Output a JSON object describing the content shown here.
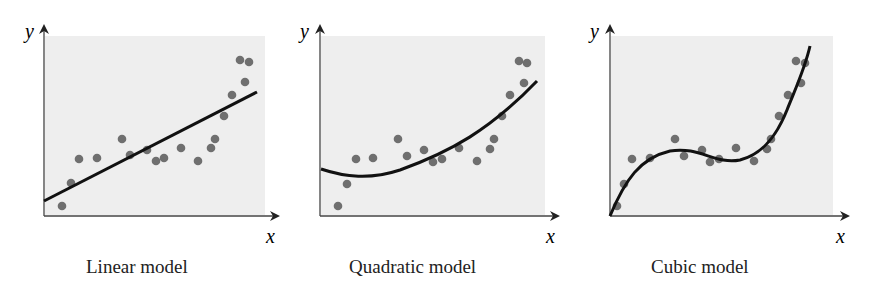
{
  "chart_data": [
    {
      "type": "scatter",
      "title": "Linear model",
      "xlabel": "x",
      "ylabel": "y",
      "grid": false,
      "points_px": [
        [
          62,
          206
        ],
        [
          71,
          183
        ],
        [
          79,
          159
        ],
        [
          97,
          158
        ],
        [
          122,
          139
        ],
        [
          130,
          155
        ],
        [
          147,
          150
        ],
        [
          156,
          161
        ],
        [
          164,
          158
        ],
        [
          181,
          148
        ],
        [
          198,
          161
        ],
        [
          211,
          148
        ],
        [
          215,
          139
        ],
        [
          224,
          116
        ],
        [
          232,
          95
        ],
        [
          245,
          82
        ],
        [
          240,
          60
        ],
        [
          249,
          62
        ]
      ],
      "fit": {
        "kind": "linear",
        "path": "M44,201 L257,92"
      }
    },
    {
      "type": "scatter",
      "title": "Quadratic model",
      "xlabel": "x",
      "ylabel": "y",
      "grid": false,
      "points_px": [
        [
          338,
          206
        ],
        [
          347,
          184
        ],
        [
          356,
          159
        ],
        [
          373,
          158
        ],
        [
          398,
          139
        ],
        [
          407,
          156
        ],
        [
          424,
          150
        ],
        [
          433,
          162
        ],
        [
          442,
          159
        ],
        [
          459,
          148
        ],
        [
          477,
          161
        ],
        [
          490,
          149
        ],
        [
          494,
          139
        ],
        [
          502,
          116
        ],
        [
          510,
          95
        ],
        [
          524,
          83
        ],
        [
          519,
          61
        ],
        [
          527,
          63
        ]
      ],
      "fit": {
        "kind": "quadratic",
        "path": "M321,169 C345,177 370,180 400,170 C450,152 490,130 537,81"
      }
    },
    {
      "type": "scatter",
      "title": "Cubic model",
      "xlabel": "x",
      "ylabel": "y",
      "grid": false,
      "points_px": [
        [
          617,
          206
        ],
        [
          624,
          184
        ],
        [
          632,
          159
        ],
        [
          650,
          158
        ],
        [
          675,
          139
        ],
        [
          684,
          156
        ],
        [
          702,
          150
        ],
        [
          710,
          162
        ],
        [
          719,
          159
        ],
        [
          736,
          148
        ],
        [
          754,
          161
        ],
        [
          767,
          149
        ],
        [
          771,
          139
        ],
        [
          779,
          116
        ],
        [
          788,
          95
        ],
        [
          801,
          83
        ],
        [
          796,
          61
        ],
        [
          805,
          63
        ]
      ],
      "fit": {
        "kind": "cubic",
        "path": "M610,216 C625,180 640,158 670,151 C700,146 715,165 740,160 C760,155 775,140 787,110 C797,85 805,68 810,46"
      }
    }
  ],
  "captions": {
    "linear": "Linear model",
    "quadratic": "Quadratic model",
    "cubic": "Cubic model"
  },
  "axis_labels": {
    "x": "x",
    "y": "y"
  },
  "colors": {
    "panel": "#eeeeee",
    "point": "#6f6f6f",
    "line": "#111111",
    "axis": "#444444"
  }
}
